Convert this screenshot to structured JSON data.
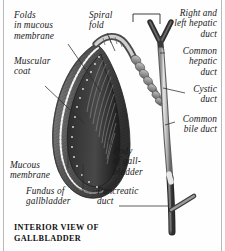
{
  "figure": {
    "caption": "INTERIOR VIEW OF\nGALLBLADDER",
    "style": "grayscale-anatomical-engraving",
    "colors": {
      "background": "#fefefe",
      "border_rule": "#b9b9b9",
      "ink": "#1a1a1a",
      "leader_line": "#2b2b2b",
      "organ_dark": "#3a3a3a",
      "organ_mid": "#6e6e6e",
      "organ_light": "#c9c9c9",
      "duct_dark": "#4a4a4a",
      "duct_light": "#d6d6d6",
      "mucosa_edge": "#f2f2f2"
    }
  },
  "labels": [
    {
      "id": "folds-in-mucous-membrane",
      "text": "Folds\nin mucous\nmembrane"
    },
    {
      "id": "muscular-coat",
      "text": "Muscular\ncoat"
    },
    {
      "id": "mucous-membrane",
      "text": "Mucous\nmembrane"
    },
    {
      "id": "fundus-of-gallbladder",
      "text": "Fundus of\ngallbladder"
    },
    {
      "id": "spiral-fold",
      "text": "Spiral\nfold"
    },
    {
      "id": "body-of-gallbladder",
      "text": "Body\nof gall-\nbladder"
    },
    {
      "id": "pancreatic-duct",
      "text": "Pancreatic\nduct"
    },
    {
      "id": "right-and-left-hepatic-duct",
      "text": "Right and\nleft hepatic\nduct"
    },
    {
      "id": "common-hepatic-duct",
      "text": "Common\nhepatic\nduct"
    },
    {
      "id": "cystic-duct",
      "text": "Cystic\nduct"
    },
    {
      "id": "common-bile-duct",
      "text": "Common\nbile duct"
    }
  ]
}
